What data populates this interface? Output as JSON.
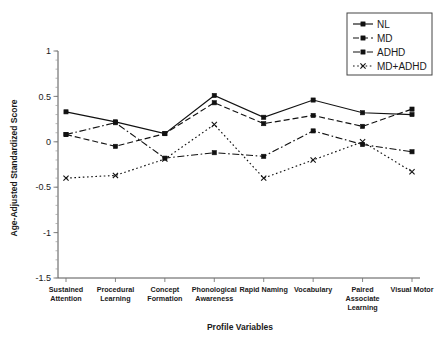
{
  "chart_data": {
    "type": "line",
    "title": "",
    "xlabel": "Profile Variables",
    "ylabel": "Age-Adjusted Standardized Score",
    "ylim": [
      -1.5,
      1
    ],
    "yticks": [
      1,
      0.5,
      0,
      -0.5,
      -1,
      -1.5
    ],
    "ytick_labels": [
      "1",
      "0.5",
      "0",
      "-0.5",
      "-1",
      "-1.5"
    ],
    "minor_tick_step": 0.1,
    "grid": false,
    "legend_position": "top-right",
    "categories": [
      "Sustained Attention",
      "Procedural Learning",
      "Concept Formation",
      "Phonological Awareness",
      "Rapid Naming",
      "Vocabulary",
      "Paired Associate Learning",
      "Visual Motor"
    ],
    "category_lines": [
      [
        "Sustained",
        "Attention"
      ],
      [
        "Procedural",
        "Learning"
      ],
      [
        "Concept",
        "Formation"
      ],
      [
        "Phonological",
        "Awareness"
      ],
      [
        "Rapid Naming"
      ],
      [
        "Vocabulary"
      ],
      [
        "Paired",
        "Associate",
        "Learning"
      ],
      [
        "Visual Motor"
      ]
    ],
    "series": [
      {
        "name": "NL",
        "dash": "none",
        "marker": "square",
        "color": "#111111",
        "values": [
          0.33,
          0.22,
          0.09,
          0.51,
          0.27,
          0.46,
          0.32,
          0.3
        ]
      },
      {
        "name": "MD",
        "dash": "dashed",
        "marker": "square",
        "color": "#111111",
        "values": [
          0.08,
          -0.05,
          0.09,
          0.43,
          0.2,
          0.29,
          0.17,
          0.36
        ]
      },
      {
        "name": "ADHD",
        "dash": "dashdot",
        "marker": "square",
        "color": "#111111",
        "values": [
          0.08,
          0.21,
          -0.18,
          -0.12,
          -0.16,
          0.12,
          -0.03,
          -0.11
        ]
      },
      {
        "name": "MD+ADHD",
        "dash": "dotted",
        "marker": "cross",
        "color": "#111111",
        "values": [
          -0.4,
          -0.37,
          -0.19,
          0.19,
          -0.4,
          -0.2,
          0.0,
          -0.33
        ]
      }
    ]
  },
  "legend": {
    "entries": [
      "NL",
      "MD",
      "ADHD",
      "MD+ADHD"
    ]
  },
  "axes": {
    "y_title": "Age-Adjusted Standardized Score",
    "x_title": "Profile Variables"
  }
}
